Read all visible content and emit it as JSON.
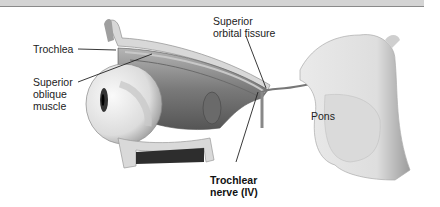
{
  "figure": {
    "labels": {
      "trochlea": "Trochlea",
      "superior_oblique_line1": "Superior",
      "superior_oblique_line2": "oblique",
      "superior_oblique_line3": "muscle",
      "superior_orbital_fissure_line1": "Superior",
      "superior_orbital_fissure_line2": "orbital fissure",
      "pons": "Pons",
      "trochlear_nerve_line1": "Trochlear",
      "trochlear_nerve_line2": "nerve (IV)"
    },
    "colors": {
      "background": "#ffffff",
      "top_band": "#d4d4d4",
      "bone": "#d9d9d9",
      "muscle": "#8c8c8c",
      "eyeball": "#eeeeee",
      "brainstem": "#e4e4e4",
      "leader_line": "#222222"
    }
  }
}
